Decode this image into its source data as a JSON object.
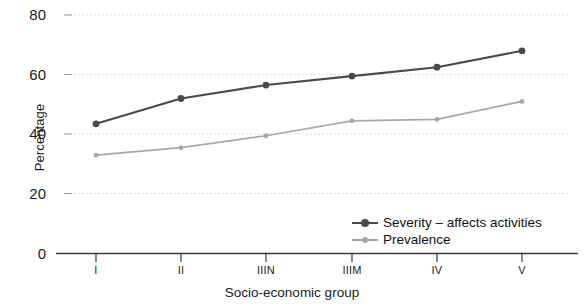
{
  "chart_data": {
    "type": "line",
    "title": "",
    "xlabel": "Socio-economic group",
    "ylabel": "Percentage",
    "categories": [
      "I",
      "II",
      "IIIN",
      "IIIM",
      "IV",
      "V"
    ],
    "ylim": [
      0,
      80
    ],
    "yticks": [
      0,
      20,
      40,
      60,
      80
    ],
    "ytick_labels": [
      "0",
      "20",
      "40",
      "60",
      "80"
    ],
    "grid": "horizontal-dotted",
    "legend_position": "inside-bottom-right",
    "series": [
      {
        "name": "Severity – affects activities",
        "color": "#4a4a4a",
        "marker": "circle",
        "values": [
          43.5,
          52,
          56.5,
          59.5,
          62.5,
          68
        ]
      },
      {
        "name": "Prevalence",
        "color": "#a8a8a8",
        "marker": "circle",
        "values": [
          33,
          35.5,
          39.5,
          44.5,
          45,
          51
        ]
      }
    ]
  },
  "axes": {
    "y_title": "Percentage",
    "x_title": "Socio-economic group",
    "y_tick_labels": [
      "80",
      "60",
      "40",
      "20",
      "0"
    ],
    "x_tick_labels": [
      "I",
      "II",
      "IIIN",
      "IIIM",
      "IV",
      "V"
    ]
  },
  "legend": {
    "items": [
      {
        "label": "Severity – affects activities",
        "color": "#4a4a4a"
      },
      {
        "label": "Prevalence",
        "color": "#a8a8a8"
      }
    ]
  },
  "colors": {
    "severity_line": "#4a4a4a",
    "prevalence_line": "#a8a8a8",
    "axis": "#3a3a3a",
    "grid": "#cfcfcf",
    "text": "#1c1c1c",
    "background": "#ffffff"
  }
}
